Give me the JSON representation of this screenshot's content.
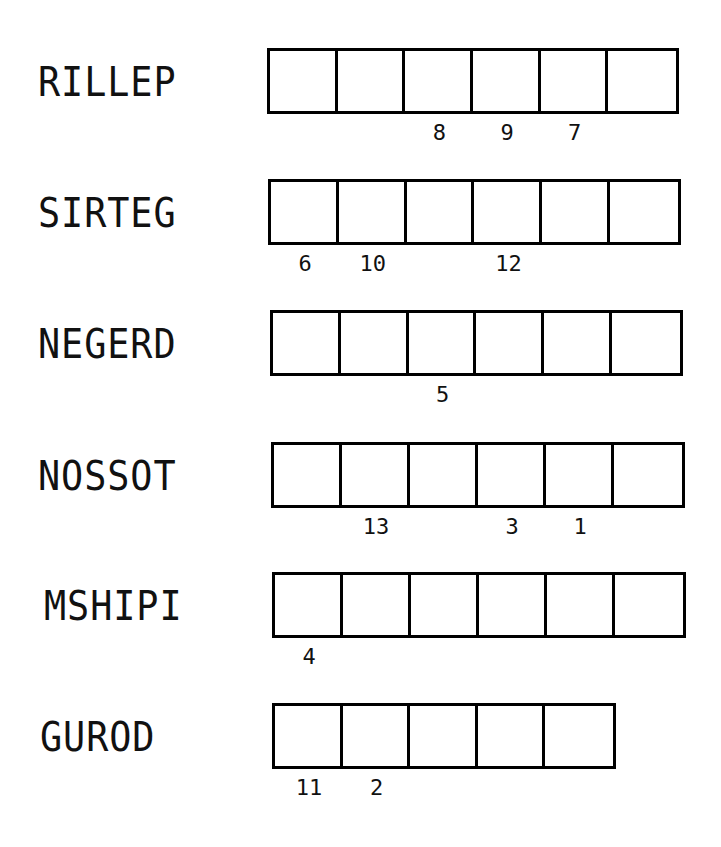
{
  "puzzle": {
    "rows": [
      {
        "scrambled": "RILLEP",
        "box_count": 6,
        "numbers": [
          "",
          "",
          "8",
          "9",
          "7",
          ""
        ]
      },
      {
        "scrambled": "SIRTEG",
        "box_count": 6,
        "numbers": [
          "6",
          "10",
          "",
          "12",
          "",
          ""
        ]
      },
      {
        "scrambled": "NEGERD",
        "box_count": 6,
        "numbers": [
          "",
          "",
          "5",
          "",
          "",
          ""
        ]
      },
      {
        "scrambled": "NOSSOT",
        "box_count": 6,
        "numbers": [
          "",
          "13",
          "",
          "3",
          "1",
          ""
        ]
      },
      {
        "scrambled": "MSHIPI",
        "box_count": 6,
        "numbers": [
          "4",
          "",
          "",
          "",
          "",
          ""
        ]
      },
      {
        "scrambled": "GUROD",
        "box_count": 5,
        "numbers": [
          "11",
          "2",
          "",
          "",
          ""
        ]
      }
    ]
  }
}
